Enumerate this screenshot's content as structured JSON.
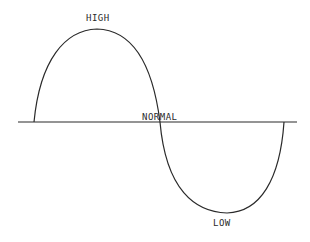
{
  "diagram": {
    "type": "sine-wave-level-diagram",
    "labels": {
      "high": "HIGH",
      "normal": "NORMAL",
      "low": "LOW"
    },
    "colors": {
      "line": "#2a2a2a",
      "background": "#ffffff"
    }
  }
}
